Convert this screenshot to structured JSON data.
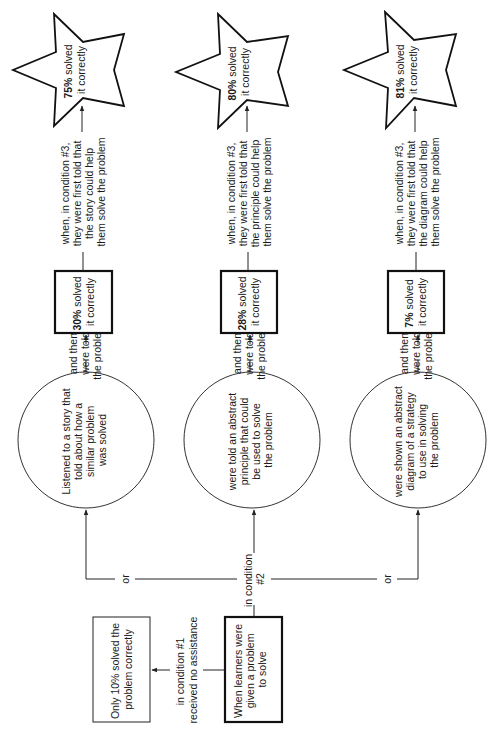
{
  "diagram": {
    "orientation": "rotated 90 degrees counter-clockwise",
    "start": {
      "label_lines": [
        "When learners were",
        "given a problem",
        "to solve"
      ]
    },
    "condition1": {
      "edge_label_lines": [
        "in condition #1",
        "received no assistance"
      ],
      "result_lines": [
        "Only 10% solved the",
        "problem correctly"
      ]
    },
    "condition2": {
      "edge_label_lines": [
        "in condition",
        "#2"
      ],
      "or_label": "or",
      "branches": [
        {
          "activity_lines": [
            "Listened to a story that",
            "told about how a",
            "similar problem",
            "was solved"
          ],
          "then_lines": [
            "and then",
            "were told",
            "the problem"
          ],
          "result_pct": "30%",
          "result_lines": [
            "solved",
            "it correctly"
          ],
          "condition3_lines": [
            "when, in condition #3,",
            "they were first told that",
            "the story could help",
            "them solve the problem"
          ],
          "star_pct": "75%",
          "star_lines": [
            "solved",
            "it correctly"
          ]
        },
        {
          "activity_lines": [
            "were told an abstract",
            "principle that could",
            "be used to solve",
            "the problem"
          ],
          "then_lines": [
            "and then",
            "were told",
            "the problem"
          ],
          "result_pct": "28%",
          "result_lines": [
            "solved",
            "it correctly"
          ],
          "condition3_lines": [
            "when, in condition #3,",
            "they were first told that",
            "the principle could help",
            "them solve the problem"
          ],
          "star_pct": "80%",
          "star_lines": [
            "solved",
            "it correctly"
          ]
        },
        {
          "activity_lines": [
            "were shown an abstract",
            "diagram of a strategy",
            "to use in solving",
            "the problem"
          ],
          "then_lines": [
            "and then",
            "were told",
            "the problem"
          ],
          "result_pct": "7%",
          "result_lines": [
            "solved",
            "it correctly"
          ],
          "condition3_lines": [
            "when, in condition #3,",
            "they were first told that",
            "the diagram could help",
            "them solve the problem"
          ],
          "star_pct": "81%",
          "star_lines": [
            "solved",
            "it correctly"
          ]
        }
      ]
    }
  }
}
